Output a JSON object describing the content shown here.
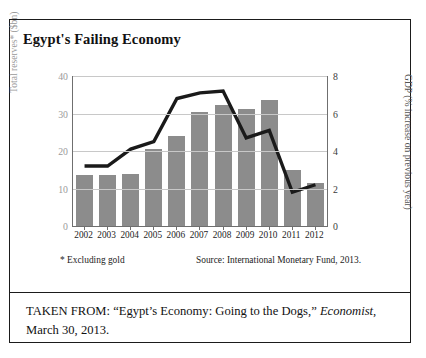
{
  "figure": {
    "title": "Egypt's Failing Economy",
    "footnote_left": "* Excluding gold",
    "footnote_right": "Source: International Monetary Fund, 2013.",
    "caption_prefix": "TAKEN FROM: “Egypt’s Economy: Going to the Dogs,” ",
    "caption_italic": "Economist",
    "caption_suffix": ", March 30, 2013.",
    "colors": {
      "bar": "#8c8c8c",
      "line": "#1a1a1a",
      "grid": "#c8c8c8",
      "axis": "#6f6f6f",
      "frame": "#1b1b1b",
      "left_axis_text": "#9a9a9a",
      "right_axis_text": "#3a3a3a"
    }
  },
  "chart_data": {
    "type": "bar",
    "title": "Egypt's Failing Economy",
    "xlabel": "",
    "ylabel": "Total reserves* ($bn)",
    "y2label": "GDP (% increase on previous year)",
    "categories": [
      "2002",
      "2003",
      "2004",
      "2005",
      "2006",
      "2007",
      "2008",
      "2009",
      "2010",
      "2011",
      "2012"
    ],
    "ylim": [
      0,
      40
    ],
    "y2lim": [
      0,
      8
    ],
    "yticks": [
      0,
      10,
      20,
      30,
      40
    ],
    "y2ticks": [
      0,
      2,
      4,
      6,
      8
    ],
    "grid": true,
    "legend": "none",
    "series": [
      {
        "name": "Total reserves* ($bn)",
        "type": "bar",
        "axis": "left",
        "values": [
          13.6,
          13.7,
          14.0,
          20.5,
          24.0,
          30.4,
          32.3,
          31.3,
          33.7,
          15.0,
          11.5
        ]
      },
      {
        "name": "GDP (% increase on previous year)",
        "type": "line",
        "axis": "right",
        "values": [
          3.2,
          3.2,
          4.1,
          4.5,
          6.8,
          7.1,
          7.2,
          4.7,
          5.1,
          1.8,
          2.2
        ]
      }
    ]
  }
}
